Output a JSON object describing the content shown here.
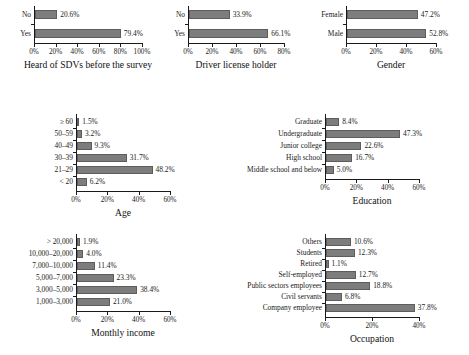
{
  "figure": {
    "bar_color": "#7d7d7d",
    "bar_edge_color": "#5d5d5d",
    "background": "#ffffff",
    "text_color": "#1a1a1a"
  },
  "chart_data": [
    {
      "id": "heard-of-sdvs",
      "type": "bar",
      "orientation": "horizontal",
      "title": "Heard of SDVs before the survey",
      "xlabel": "",
      "ylabel": "",
      "xlim": [
        0,
        100
      ],
      "xticks": [
        0,
        20,
        40,
        60,
        80,
        100
      ],
      "xticklabels": [
        "0%",
        "20%",
        "40%",
        "60%",
        "80%",
        "100%"
      ],
      "grid": false,
      "legend": null,
      "categories": [
        "Yes",
        "No"
      ],
      "values": [
        79.4,
        20.6
      ],
      "datalabels": [
        "79.4%",
        "20.6%"
      ]
    },
    {
      "id": "driver-license-holder",
      "type": "bar",
      "orientation": "horizontal",
      "title": "Driver license holder",
      "xlabel": "",
      "ylabel": "",
      "xlim": [
        0,
        80
      ],
      "xticks": [
        0,
        20,
        40,
        60,
        80
      ],
      "xticklabels": [
        "0%",
        "20%",
        "40%",
        "60%",
        "80%"
      ],
      "grid": false,
      "legend": null,
      "categories": [
        "Yes",
        "No"
      ],
      "values": [
        66.1,
        33.9
      ],
      "datalabels": [
        "66.1%",
        "33.9%"
      ]
    },
    {
      "id": "gender",
      "type": "bar",
      "orientation": "horizontal",
      "title": "Gender",
      "xlabel": "",
      "ylabel": "",
      "xlim": [
        0,
        60
      ],
      "xticks": [
        0,
        20,
        40,
        60
      ],
      "xticklabels": [
        "0%",
        "20%",
        "40%",
        "60%"
      ],
      "grid": false,
      "legend": null,
      "categories": [
        "Male",
        "Female"
      ],
      "values": [
        52.8,
        47.2
      ],
      "datalabels": [
        "52.8%",
        "47.2%"
      ]
    },
    {
      "id": "age",
      "type": "bar",
      "orientation": "horizontal",
      "title": "Age",
      "xlabel": "",
      "ylabel": "",
      "xlim": [
        0,
        60
      ],
      "xticks": [
        0,
        20,
        40,
        60
      ],
      "xticklabels": [
        "0%",
        "20%",
        "40%",
        "60%"
      ],
      "grid": false,
      "legend": null,
      "categories": [
        "< 20",
        "21–29",
        "30–39",
        "40–49",
        "50–59",
        "≥ 60"
      ],
      "values": [
        6.2,
        48.2,
        31.7,
        9.3,
        3.2,
        1.5
      ],
      "datalabels": [
        "6.2%",
        "48.2%",
        "31.7%",
        "9.3%",
        "3.2%",
        "1.5%"
      ]
    },
    {
      "id": "education",
      "type": "bar",
      "orientation": "horizontal",
      "title": "Education",
      "xlabel": "",
      "ylabel": "",
      "xlim": [
        0,
        60
      ],
      "xticks": [
        0,
        20,
        40,
        60
      ],
      "xticklabels": [
        "0%",
        "20%",
        "40%",
        "60%"
      ],
      "grid": false,
      "legend": null,
      "categories": [
        "Middle school and below",
        "High school",
        "Junior college",
        "Undergraduate",
        "Graduate"
      ],
      "values": [
        5.0,
        16.7,
        22.6,
        47.3,
        8.4
      ],
      "datalabels": [
        "5.0%",
        "16.7%",
        "22.6%",
        "47.3%",
        "8.4%"
      ]
    },
    {
      "id": "monthly-income",
      "type": "bar",
      "orientation": "horizontal",
      "title": "Monthly income",
      "xlabel": "",
      "ylabel": "",
      "xlim": [
        0,
        60
      ],
      "xticks": [
        0,
        20,
        40,
        60
      ],
      "xticklabels": [
        "0%",
        "20%",
        "40%",
        "60%"
      ],
      "grid": false,
      "legend": null,
      "categories": [
        "1,000–3,000",
        "3,000–5,000",
        "5,000–7,000",
        "7,000–10,000",
        "10,000–20,000",
        "> 20,000"
      ],
      "values": [
        21.0,
        38.4,
        23.3,
        11.4,
        4.0,
        1.9
      ],
      "datalabels": [
        "21.0%",
        "38.4%",
        "23.3%",
        "11.4%",
        "4.0%",
        "1.9%"
      ]
    },
    {
      "id": "occupation",
      "type": "bar",
      "orientation": "horizontal",
      "title": "Occupation",
      "xlabel": "",
      "ylabel": "",
      "xlim": [
        0,
        40
      ],
      "xticks": [
        0,
        20,
        40
      ],
      "xticklabels": [
        "0%",
        "20%",
        "40%"
      ],
      "grid": false,
      "legend": null,
      "categories": [
        "Company employee",
        "Civil servants",
        "Public sectors employees",
        "Self-employed",
        "Retired",
        "Students",
        "Others"
      ],
      "values": [
        37.8,
        6.8,
        18.8,
        12.7,
        1.1,
        12.3,
        10.6
      ],
      "datalabels": [
        "37.8%",
        "6.8%",
        "18.8%",
        "12.7%",
        "1.1%",
        "12.3%",
        "10.6%"
      ]
    }
  ],
  "layout": {
    "panels": [
      {
        "id": "heard-of-sdvs",
        "left": 2,
        "top": 4,
        "width": 152,
        "height": 96,
        "axis_left": 32,
        "axis_right": 140,
        "bar_h": 9,
        "gap": 10,
        "label_gap": 3,
        "title_top": 80
      },
      {
        "id": "driver-license-holder",
        "left": 156,
        "top": 4,
        "width": 148,
        "height": 96,
        "axis_left": 32,
        "axis_right": 128,
        "bar_h": 9,
        "gap": 10,
        "label_gap": 3,
        "title_top": 80
      },
      {
        "id": "gender",
        "left": 306,
        "top": 4,
        "width": 163,
        "height": 96,
        "axis_left": 40,
        "axis_right": 130,
        "bar_h": 9,
        "gap": 10,
        "label_gap": 3,
        "title_top": 80
      },
      {
        "id": "age",
        "left": 10,
        "top": 112,
        "width": 215,
        "height": 100,
        "axis_left": 66,
        "axis_right": 160,
        "bar_h": 8,
        "gap": 4,
        "label_gap": 3,
        "title_top": 86
      },
      {
        "id": "education",
        "left": 229,
        "top": 112,
        "width": 240,
        "height": 100,
        "axis_left": 96,
        "axis_right": 190,
        "bar_h": 8,
        "gap": 4,
        "label_gap": 3,
        "title_top": 86
      },
      {
        "id": "monthly-income",
        "left": 6,
        "top": 232,
        "width": 219,
        "height": 118,
        "axis_left": 70,
        "axis_right": 164,
        "bar_h": 8,
        "gap": 4,
        "label_gap": 3,
        "title_top": 100
      },
      {
        "id": "occupation",
        "left": 229,
        "top": 232,
        "width": 240,
        "height": 118,
        "axis_left": 96,
        "axis_right": 190,
        "bar_h": 8,
        "gap": 3,
        "label_gap": 3,
        "title_top": 100
      }
    ]
  }
}
